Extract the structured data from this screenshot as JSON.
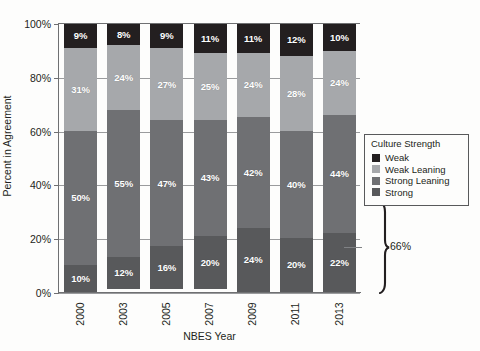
{
  "chart_data": {
    "type": "bar",
    "subtype": "stacked-bar-100-percent",
    "title": "",
    "xlabel": "NBES Year",
    "ylabel": "Percent in Agreement",
    "categories": [
      "2000",
      "2003",
      "2005",
      "2007",
      "2009",
      "2011",
      "2013"
    ],
    "ylim": [
      0,
      100
    ],
    "ytick_labels": [
      "0%",
      "20%",
      "40%",
      "60%",
      "80%",
      "100%"
    ],
    "ytick_values": [
      0,
      20,
      40,
      60,
      80,
      100
    ],
    "grid": true,
    "legend_position": "right",
    "legend_title": "Culture Strength",
    "series": [
      {
        "name": "Strong",
        "color": "#58595b",
        "values": [
          10,
          12,
          16,
          20,
          24,
          20,
          22
        ],
        "labels": [
          "10%",
          "12%",
          "16%",
          "20%",
          "24%",
          "20%",
          "22%"
        ]
      },
      {
        "name": "Strong Leaning",
        "color": "#6f7073",
        "values": [
          50,
          55,
          47,
          43,
          42,
          40,
          44
        ],
        "labels": [
          "50%",
          "55%",
          "47%",
          "43%",
          "42%",
          "40%",
          "44%"
        ]
      },
      {
        "name": "Weak Leaning",
        "color": "#a6a8ab",
        "values": [
          31,
          24,
          27,
          25,
          24,
          28,
          24
        ],
        "labels": [
          "31%",
          "24%",
          "27%",
          "25%",
          "24%",
          "28%",
          "24%"
        ]
      },
      {
        "name": "Weak",
        "color": "#231f20",
        "values": [
          9,
          8,
          9,
          11,
          11,
          12,
          10
        ],
        "labels": [
          "9%",
          "8%",
          "9%",
          "11%",
          "11%",
          "12%",
          "10%"
        ]
      }
    ],
    "stack_order_bottom_to_top": [
      "Strong",
      "Strong Leaning",
      "Weak Leaning",
      "Weak"
    ],
    "annotations": [
      {
        "type": "brace",
        "label": "66%",
        "target_category": "2013",
        "covers_series": [
          "Strong",
          "Strong Leaning"
        ],
        "value": 66,
        "span_percent": [
          0,
          66
        ]
      }
    ]
  },
  "axes": {
    "y_title": "Percent in Agreement",
    "x_title": "NBES Year",
    "y_ticks": [
      "100%",
      "80%",
      "60%",
      "40%",
      "20%",
      "0%"
    ],
    "x_ticks": [
      "2000",
      "2003",
      "2005",
      "2007",
      "2009",
      "2011",
      "2013"
    ]
  },
  "legend": {
    "title": "Culture Strength",
    "items": [
      {
        "label": "Weak",
        "color": "#231f20"
      },
      {
        "label": "Weak Leaning",
        "color": "#a6a8ab"
      },
      {
        "label": "Strong Leaning",
        "color": "#6f7073"
      },
      {
        "label": "Strong",
        "color": "#58595b"
      }
    ]
  },
  "annotation": {
    "brace_label": "66%"
  },
  "colors": {
    "background": "#fdfdfc",
    "axis": "#6f7072",
    "gridline": "#9a9b9d",
    "text": "#231f20",
    "label_text": "#ffffff"
  }
}
